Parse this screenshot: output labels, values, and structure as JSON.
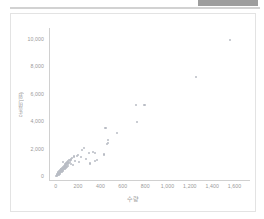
{
  "header": {
    "redacted_block_color": "#9d9d9d",
    "rule_color": "#d2d2d2"
  },
  "chart_data": {
    "type": "scatter",
    "title": "",
    "xlabel": "수량",
    "ylabel": "운송비(원)",
    "xlim": [
      -60,
      1720
    ],
    "ylim": [
      -300,
      10800
    ],
    "grid": false,
    "legend": "none",
    "marker_color": "#b9bcc4",
    "axis_color": "#d0d0d0",
    "tick_color": "#9a9a9a",
    "xticks": [
      "0",
      "200",
      "400",
      "600",
      "800",
      "1,000",
      "1,200",
      "1,400",
      "1,600"
    ],
    "xtick_values": [
      0,
      200,
      400,
      600,
      800,
      1000,
      1200,
      1400,
      1600
    ],
    "yticks": [
      "0",
      "2,000",
      "4,000",
      "6,000",
      "8,000",
      "10,000"
    ],
    "ytick_values": [
      0,
      2000,
      4000,
      6000,
      8000,
      10000
    ],
    "points": [
      [
        1560,
        9950
      ],
      [
        1255,
        7250
      ],
      [
        795,
        5200
      ],
      [
        720,
        5150
      ],
      [
        725,
        3950
      ],
      [
        445,
        3500
      ],
      [
        550,
        3150
      ],
      [
        470,
        2620
      ],
      [
        465,
        2380
      ],
      [
        462,
        2300
      ],
      [
        250,
        2050
      ],
      [
        238,
        1880
      ],
      [
        330,
        1720
      ],
      [
        355,
        1700
      ],
      [
        300,
        1680
      ],
      [
        430,
        1560
      ],
      [
        200,
        1520
      ],
      [
        190,
        1480
      ],
      [
        160,
        1420
      ],
      [
        225,
        1380
      ],
      [
        370,
        1180
      ],
      [
        148,
        1300
      ],
      [
        140,
        1240
      ],
      [
        132,
        1180
      ],
      [
        120,
        1150
      ],
      [
        175,
        1100
      ],
      [
        112,
        1060
      ],
      [
        128,
        1010
      ],
      [
        105,
        980
      ],
      [
        118,
        940
      ],
      [
        95,
        910
      ],
      [
        108,
        880
      ],
      [
        138,
        860
      ],
      [
        88,
        840
      ],
      [
        100,
        810
      ],
      [
        92,
        780
      ],
      [
        80,
        760
      ],
      [
        110,
        740
      ],
      [
        72,
        720
      ],
      [
        85,
        690
      ],
      [
        96,
        665
      ],
      [
        66,
        640
      ],
      [
        78,
        620
      ],
      [
        88,
        600
      ],
      [
        58,
        580
      ],
      [
        70,
        560
      ],
      [
        82,
        545
      ],
      [
        52,
        520
      ],
      [
        62,
        500
      ],
      [
        74,
        485
      ],
      [
        46,
        465
      ],
      [
        56,
        445
      ],
      [
        66,
        430
      ],
      [
        40,
        410
      ],
      [
        50,
        395
      ],
      [
        60,
        375
      ],
      [
        34,
        355
      ],
      [
        44,
        340
      ],
      [
        54,
        320
      ],
      [
        28,
        300
      ],
      [
        38,
        285
      ],
      [
        48,
        265
      ],
      [
        24,
        245
      ],
      [
        32,
        230
      ],
      [
        42,
        210
      ],
      [
        18,
        195
      ],
      [
        26,
        175
      ],
      [
        36,
        160
      ],
      [
        14,
        140
      ],
      [
        22,
        125
      ],
      [
        30,
        105
      ],
      [
        10,
        90
      ],
      [
        18,
        70
      ],
      [
        8,
        50
      ],
      [
        14,
        35
      ],
      [
        5,
        20
      ],
      [
        64,
        1020
      ],
      [
        155,
        780
      ],
      [
        205,
        1020
      ],
      [
        268,
        1250
      ],
      [
        310,
        900
      ],
      [
        352,
        1080
      ]
    ]
  }
}
